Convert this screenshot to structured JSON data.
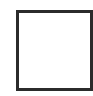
{
  "checkbox": {
    "checked": false,
    "border_color": "#2b2b2b",
    "fill_color": "#ffffff"
  }
}
